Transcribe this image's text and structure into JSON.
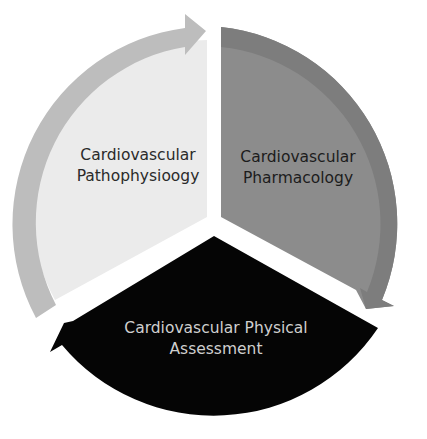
{
  "diagram": {
    "type": "cycle",
    "segments": [
      {
        "id": "pathophysiology",
        "line1": "Cardiovascular",
        "line2": "Pathophysiology",
        "fill": "#ebebeb",
        "band": "#bdbdbd",
        "text_color": "#2a2a2a"
      },
      {
        "id": "pharmacology",
        "line1": "Cardiovascular",
        "line2": "Pharmacology",
        "fill": "#8c8c8c",
        "band": "#7d7d7d",
        "text_color": "#1c1c1c"
      },
      {
        "id": "physical-assessment",
        "line1": "Cardiovascular Physical",
        "line2": "Assessment",
        "fill": "#050505",
        "band": "#050505",
        "text_color": "#cfcfcf"
      }
    ]
  }
}
